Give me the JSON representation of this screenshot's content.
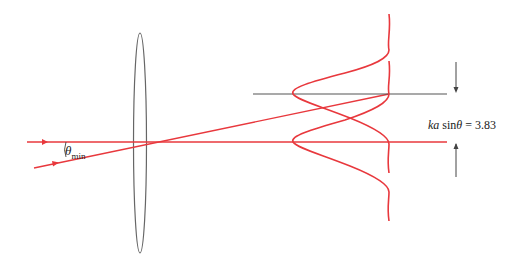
{
  "figure": {
    "labels": {
      "theta_symbol": "θ",
      "theta_subscript": "min",
      "formula_prefix": "ka",
      "formula_func": " sin",
      "formula_var": "θ",
      "formula_rest": " = 3.83"
    },
    "colors": {
      "ray": "#e8383d",
      "lens": "#666666",
      "axis_line": "#555555",
      "arrow": "#444444",
      "text": "#222222"
    }
  }
}
